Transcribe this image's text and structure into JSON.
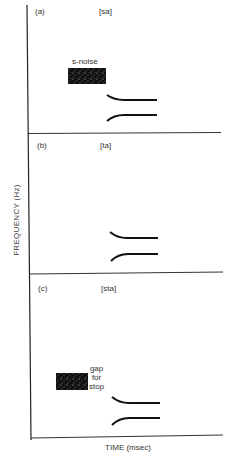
{
  "figure": {
    "y_axis_label": "FREQUENCY (Hz)",
    "x_axis_label": "TIME (msec)",
    "colors": {
      "ink": "#1a1a1a",
      "background": "#ffffff"
    },
    "panels": [
      {
        "id": "a",
        "tag": "(a)",
        "syllable": "[sa]",
        "noise_label": "s-noise",
        "has_noise": true
      },
      {
        "id": "b",
        "tag": "(b)",
        "syllable": "[ta]",
        "has_noise": false
      },
      {
        "id": "c",
        "tag": "(c)",
        "syllable": "[sta]",
        "noise_label": "gap\nfor\nstop",
        "gap_lines": [
          "gap",
          "for",
          "stop"
        ],
        "has_noise": true
      }
    ]
  }
}
